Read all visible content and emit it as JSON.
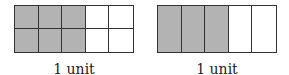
{
  "colors": {
    "shaded": "#b3b3b3",
    "unshaded": "#ffffff",
    "border": "#333333"
  },
  "diagrams": [
    {
      "rows": 2,
      "cols": 5,
      "shaded_cols": 3,
      "label": "1 unit"
    },
    {
      "rows": 1,
      "cols": 5,
      "shaded_cols": 3,
      "label": "1 unit"
    }
  ]
}
